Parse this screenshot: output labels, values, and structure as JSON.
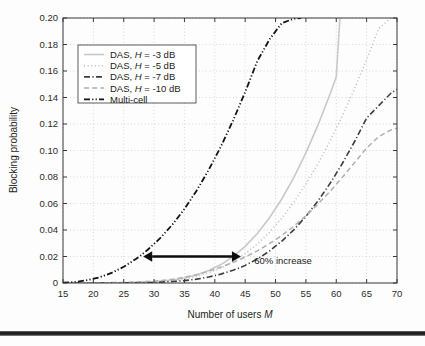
{
  "figure": {
    "background": "#fdfdfd",
    "frame_color": "#3a3a3a",
    "grid_color": "#c8c8c8",
    "page_rule_color": "#161616"
  },
  "chart_data": {
    "type": "line",
    "title": "",
    "xlabel_prefix": "Number of users ",
    "xlabel_symbol": "M",
    "ylabel": "Blocking probability",
    "xlim": [
      15,
      70
    ],
    "ylim": [
      0,
      0.2
    ],
    "xticks": [
      15,
      20,
      25,
      30,
      35,
      40,
      45,
      50,
      55,
      60,
      65,
      70
    ],
    "xtick_labels": [
      "15",
      "20",
      "25",
      "30",
      "35",
      "40",
      "45",
      "50",
      "55",
      "60",
      "65",
      "70"
    ],
    "yticks": [
      0,
      0.02,
      0.04,
      0.06,
      0.08,
      0.1,
      0.12,
      0.14,
      0.16,
      0.18,
      0.2
    ],
    "ytick_labels": [
      "0",
      "0.02",
      "0.04",
      "0.06",
      "0.08",
      "0.10",
      "0.12",
      "0.14",
      "0.16",
      "0.18",
      "0.20"
    ],
    "grid": true,
    "legend_position": "upper left",
    "series": [
      {
        "name": "DAS, H = -3 dB",
        "label_prefix": "DAS, ",
        "label_symbol": "H",
        "label_suffix": " = -3 dB",
        "style": "solid",
        "color": "#c9c9c9",
        "width": 1.6,
        "x": [
          15,
          20,
          25,
          30,
          33,
          35,
          37,
          39,
          41,
          43,
          45,
          47,
          49,
          51,
          53,
          55,
          57,
          59,
          60,
          60.6
        ],
        "y": [
          0,
          0,
          0.0002,
          0.0009,
          0.0022,
          0.0038,
          0.0061,
          0.0094,
          0.0139,
          0.0199,
          0.0277,
          0.0374,
          0.0492,
          0.0632,
          0.0795,
          0.0982,
          0.1193,
          0.1428,
          0.1556,
          0.2
        ]
      },
      {
        "name": "DAS, H = -5 dB",
        "label_prefix": "DAS, ",
        "label_symbol": "H",
        "label_suffix": " = -5 dB",
        "style": "dotted",
        "color": "#bcbcbc",
        "width": 1.5,
        "x": [
          15,
          20,
          25,
          30,
          33,
          35,
          37,
          39,
          41,
          43,
          45,
          47,
          49,
          51,
          53,
          55,
          57,
          59,
          61,
          63,
          65,
          67,
          69,
          70
        ],
        "y": [
          0,
          0,
          0.0001,
          0.0007,
          0.0018,
          0.0031,
          0.005,
          0.0077,
          0.0113,
          0.016,
          0.022,
          0.0294,
          0.0383,
          0.0488,
          0.0609,
          0.0747,
          0.0902,
          0.1074,
          0.1262,
          0.1466,
          0.1686,
          0.1921,
          0.2,
          0.2
        ]
      },
      {
        "name": "DAS, H = -7 dB",
        "label_prefix": "DAS, ",
        "label_symbol": "H",
        "label_suffix": " = -7 dB",
        "style": "dashdot",
        "color": "#3d3d3d",
        "width": 1.6,
        "x": [
          15,
          20,
          25,
          30,
          33,
          35,
          37,
          39,
          41,
          43,
          44,
          45,
          47,
          49,
          51,
          53,
          55,
          57,
          59,
          61,
          63,
          65,
          67,
          69,
          70
        ],
        "y": [
          0,
          0,
          0.0001,
          0.0004,
          0.0011,
          0.0018,
          0.0029,
          0.0045,
          0.0067,
          0.0096,
          0.0113,
          0.0133,
          0.0181,
          0.0241,
          0.0314,
          0.0401,
          0.0503,
          0.062,
          0.0753,
          0.0902,
          0.1066,
          0.1245,
          0.1339,
          0.1432,
          0.1462
        ]
      },
      {
        "name": "DAS, H = -10 dB",
        "label_prefix": "DAS, ",
        "label_symbol": "H",
        "label_suffix": " = -10 dB",
        "style": "dashed",
        "color": "#b0b0b0",
        "width": 1.5,
        "x": [
          15,
          20,
          25,
          30,
          33,
          35,
          37,
          39,
          41,
          43,
          45,
          47,
          49,
          51,
          53,
          55,
          57,
          59,
          61,
          63,
          65,
          67,
          69,
          70
        ],
        "y": [
          0,
          0.0001,
          0.0004,
          0.0014,
          0.0028,
          0.0043,
          0.0063,
          0.0089,
          0.012,
          0.0155,
          0.0196,
          0.0243,
          0.0297,
          0.0358,
          0.0428,
          0.0507,
          0.0596,
          0.0693,
          0.0798,
          0.0908,
          0.1019,
          0.1105,
          0.1155,
          0.1168
        ]
      },
      {
        "name": "Multi-cell",
        "label_prefix": "Multi-cell",
        "label_symbol": "",
        "label_suffix": "",
        "style": "dashdotdot",
        "color": "#131313",
        "width": 1.8,
        "x": [
          15,
          17,
          19,
          21,
          23,
          25,
          27,
          28,
          29,
          31,
          33,
          35,
          37,
          39,
          41,
          43,
          45,
          47,
          49,
          51,
          53,
          54.2
        ],
        "y": [
          0.0002,
          0.0008,
          0.0021,
          0.0043,
          0.0076,
          0.0122,
          0.0181,
          0.0215,
          0.0253,
          0.0338,
          0.044,
          0.0559,
          0.0697,
          0.0854,
          0.103,
          0.1226,
          0.1441,
          0.1675,
          0.1838,
          0.196,
          0.1995,
          0.2
        ]
      }
    ],
    "annotations": [
      {
        "name": "increase-arrow",
        "type": "double-arrow",
        "x_start": 28.2,
        "x_end": 44.3,
        "y": 0.02,
        "color": "#0d0d0d"
      },
      {
        "name": "increase-label",
        "type": "text",
        "text": "60% increase",
        "x": 46.5,
        "y": 0.0145
      }
    ]
  }
}
